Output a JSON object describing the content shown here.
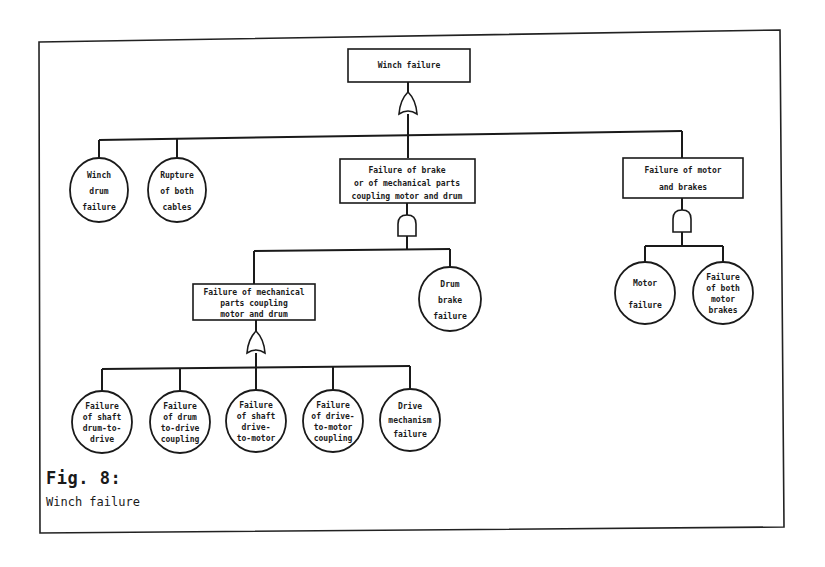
{
  "figure": {
    "number": "Fig. 8:",
    "caption": "Winch failure"
  },
  "tree": {
    "top": {
      "id": "winch-failure",
      "lines": [
        "Winch failure"
      ],
      "gate": "OR"
    },
    "level1": [
      {
        "id": "winch-drum-failure",
        "type": "basic",
        "lines": [
          "Winch",
          "drum",
          "failure"
        ]
      },
      {
        "id": "rupture-of-both-cables",
        "type": "basic",
        "lines": [
          "Rupture",
          "of both",
          "cables"
        ]
      },
      {
        "id": "failure-brake-or-mech-parts",
        "type": "intermediate",
        "gate": "AND",
        "lines": [
          "Failure of brake",
          "or of mechanical parts",
          "coupling motor and drum"
        ]
      },
      {
        "id": "failure-motor-and-brakes",
        "type": "intermediate",
        "gate": "AND",
        "lines": [
          "Failure of motor",
          "and brakes"
        ]
      }
    ],
    "level2_brake_branch": [
      {
        "id": "failure-mech-parts-coupling",
        "type": "intermediate",
        "gate": "OR",
        "lines": [
          "Failure of mechanical",
          "parts coupling",
          "motor and drum"
        ]
      },
      {
        "id": "drum-brake-failure",
        "type": "basic",
        "lines": [
          "Drum",
          "brake",
          "failure"
        ]
      }
    ],
    "level2_motor_branch": [
      {
        "id": "motor-failure",
        "type": "basic",
        "lines": [
          "Motor",
          "failure"
        ]
      },
      {
        "id": "failure-both-motor-brakes",
        "type": "basic",
        "lines": [
          "Failure",
          "of both",
          "motor",
          "brakes"
        ]
      }
    ],
    "level3": [
      {
        "id": "failure-shaft-drum-to-drive",
        "type": "basic",
        "lines": [
          "Failure",
          "of shaft",
          "drum-to-",
          "drive"
        ]
      },
      {
        "id": "failure-drum-to-drive-coupling",
        "type": "basic",
        "lines": [
          "Failure",
          "of drum",
          "to-drive",
          "coupling"
        ]
      },
      {
        "id": "failure-shaft-drive-to-motor",
        "type": "basic",
        "lines": [
          "Failure",
          "of shaft",
          "drive-",
          "to-motor"
        ]
      },
      {
        "id": "failure-drive-to-motor-coupling",
        "type": "basic",
        "lines": [
          "Failure",
          "of drive-",
          "to-motor",
          "coupling"
        ]
      },
      {
        "id": "drive-mechanism-failure",
        "type": "basic",
        "lines": [
          "Drive",
          "mechanism",
          "failure"
        ]
      }
    ]
  }
}
